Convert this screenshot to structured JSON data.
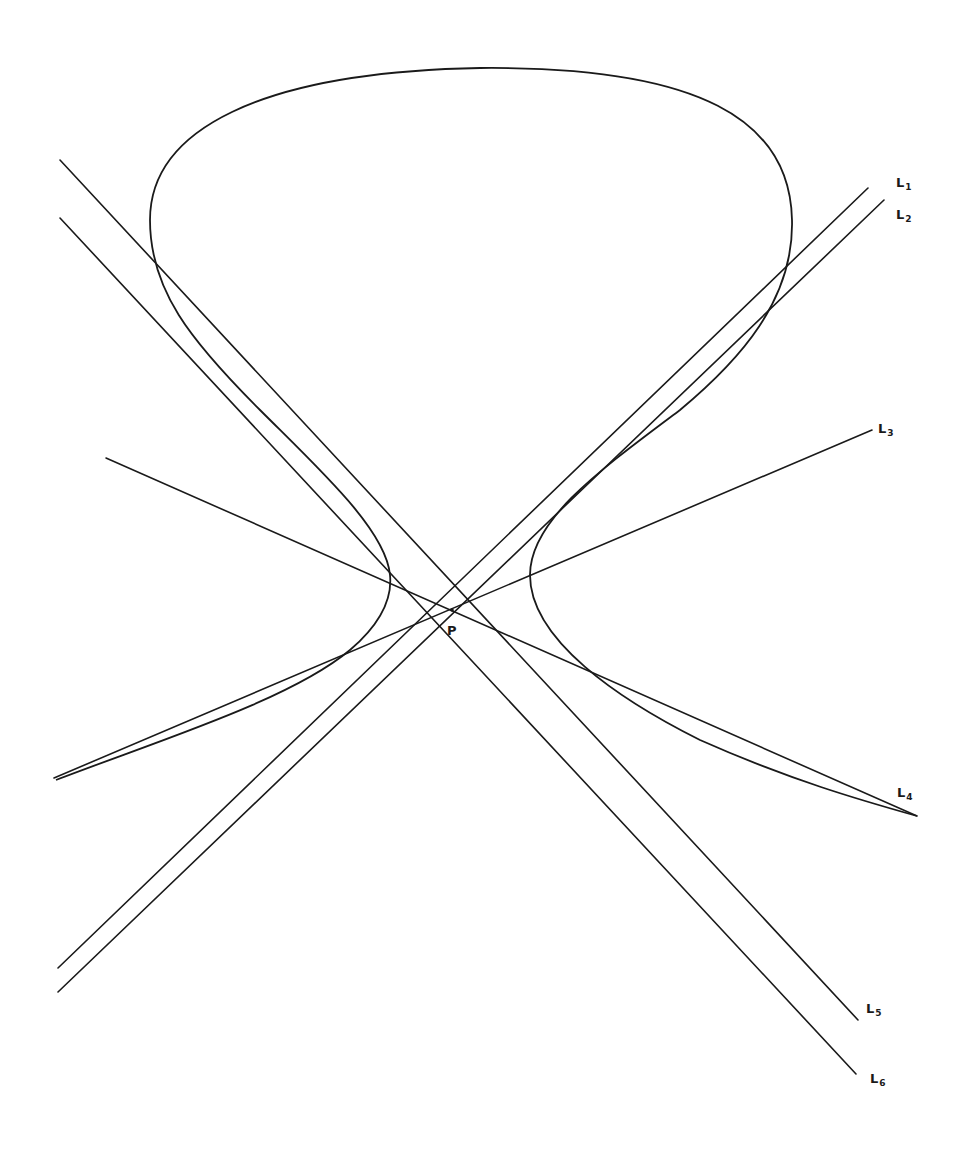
{
  "diagram": {
    "type": "geometric-construction",
    "point": {
      "label": "P",
      "x": 452,
      "y": 610,
      "label_x": 447,
      "label_y": 624
    },
    "lines": [
      {
        "id": "L1",
        "name": "L",
        "sub": "1",
        "x1": 868,
        "y1": 188,
        "x2": 58,
        "y2": 968,
        "label_x": 896,
        "label_y": 176
      },
      {
        "id": "L2",
        "name": "L",
        "sub": "2",
        "x1": 884,
        "y1": 200,
        "x2": 58,
        "y2": 992,
        "label_x": 896,
        "label_y": 208
      },
      {
        "id": "L3",
        "name": "L",
        "sub": "3",
        "x1": 872,
        "y1": 430,
        "x2": 54,
        "y2": 778,
        "label_x": 878,
        "label_y": 422
      },
      {
        "id": "L4",
        "name": "L",
        "sub": "4",
        "x1": 106,
        "y1": 458,
        "x2": 917,
        "y2": 816,
        "label_x": 897,
        "label_y": 786
      },
      {
        "id": "L5",
        "name": "L",
        "sub": "5",
        "x1": 60,
        "y1": 160,
        "x2": 858,
        "y2": 1020,
        "label_x": 866,
        "label_y": 1002
      },
      {
        "id": "L6",
        "name": "L",
        "sub": "6",
        "x1": 60,
        "y1": 218,
        "x2": 856,
        "y2": 1074,
        "label_x": 870,
        "label_y": 1072
      }
    ],
    "curve": {
      "path": "M 56 780 C 160 740, 290 700, 350 650 C 385 620, 392 595, 390 575 C 386 530, 320 470, 260 410 C 190 340, 150 290, 150 220 C 150 130, 260 72, 480 68 C 700 66, 790 120, 792 220 C 794 300, 740 360, 680 410 C 600 470, 530 520, 530 575 C 530 640, 620 700, 700 740 C 790 780, 860 800, 917 816"
    }
  }
}
